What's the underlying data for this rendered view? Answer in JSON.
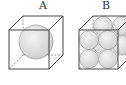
{
  "figures": [
    {
      "label": "A",
      "description": "cube with one inscribed sphere"
    },
    {
      "label": "B",
      "description": "cube with eight spheres packed 2x2x2"
    }
  ],
  "colors": {
    "line": "#333333",
    "sphere_fill": "#d9d9d9",
    "sphere_stroke": "#888888"
  }
}
